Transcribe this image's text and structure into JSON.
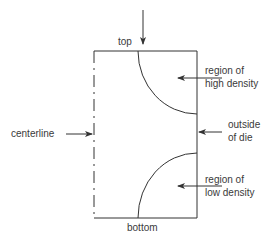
{
  "diagram": {
    "labels": {
      "top": "top",
      "bottom": "bottom",
      "centerline": "centerline",
      "high_density_line1": "region of",
      "high_density_line2": "high density",
      "outside_line1": "outside",
      "outside_line2": "of die",
      "low_density_line1": "region of",
      "low_density_line2": "low density"
    },
    "colors": {
      "stroke": "#333333",
      "background": "#ffffff"
    }
  }
}
